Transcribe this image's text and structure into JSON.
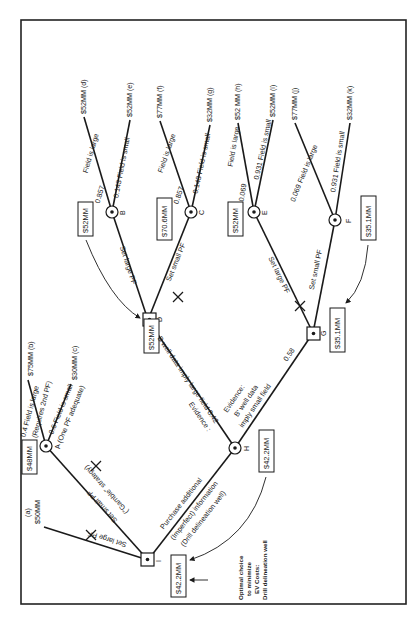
{
  "diagram": {
    "type": "decision-tree",
    "orientation": "rotated-90-ccw",
    "nodes": {
      "I": {
        "label": "I",
        "kind": "decision",
        "value": "$42.2MM"
      },
      "A": {
        "label": "A",
        "kind": "chance",
        "value": "$48MM"
      },
      "H": {
        "label": "H",
        "kind": "chance",
        "value": "$42.2MM"
      },
      "D": {
        "label": "D",
        "kind": "decision",
        "value": "$52MM"
      },
      "G": {
        "label": "G",
        "kind": "decision",
        "value": "$35.1MM"
      },
      "B": {
        "label": "B",
        "kind": "chance",
        "value": "$52MM"
      },
      "C": {
        "label": "C",
        "kind": "chance",
        "value": "$70.6MM"
      },
      "E": {
        "label": "E",
        "kind": "chance",
        "value": "$52MM"
      },
      "F": {
        "label": "F",
        "kind": "chance",
        "value": "$35.1MM"
      }
    },
    "branches": {
      "I_large": "Set large PF",
      "I_small_1": "Set small PF",
      "I_small_2": "(\"Gamble\" strategy)",
      "I_info_1": "Purchase additional",
      "I_info_2": "(Imperfect) information",
      "I_info_3": "(Drill delineation well)",
      "A_large_1": "0.4   Field is large",
      "A_large_2": "(Requires 2nd PF)",
      "A_small_1": "0.6 Field is small",
      "A_small_2": "(One  PF adequate)",
      "H_large_1": "Evidence :",
      "H_large_2": "B  well data imply large field 0.42",
      "H_small_1": "Evidence:",
      "H_small_2": "B'  well data",
      "H_small_3": "imply small field",
      "H_small_prob": "0.58",
      "D_large": "Set large PF",
      "D_small": "Set small PF",
      "G_large": "Set large PF",
      "G_small": "Set small PF",
      "B_large": "Field is large",
      "B_large_p": "0.857",
      "B_small": "0.143 Field is small",
      "C_large": "Field is large",
      "C_large_p": "0.857",
      "C_small": "0.143 Field is small",
      "E_large": "Field is large",
      "E_large_p": "0.069",
      "E_small": "0.931  Field is small",
      "F_large": "0.069 Field is large",
      "F_small": "0.931  Field is small"
    },
    "outcomes": {
      "a": "$50MM",
      "a_tag": "(a)",
      "b": "$75MM (b)",
      "c": "$30MM (c)",
      "d": "$52MM (d)",
      "e": "$52MM (e)",
      "f": "$77MM (f)",
      "g": "$32MM (g)",
      "h": "$52 MM (h)",
      "i": "$52MM (i)",
      "j": "$77MM (j)",
      "k": "$32MM (k)"
    },
    "note": {
      "line1": "Optimal choice",
      "line2": "to minimize",
      "line3": "EV Costs:",
      "line4": "Drill delineation well"
    }
  }
}
